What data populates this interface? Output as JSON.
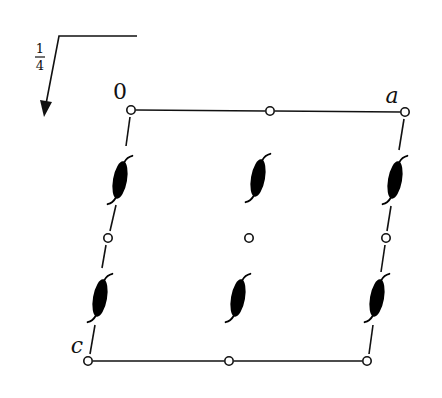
{
  "figure": {
    "type": "space-group symmetry diagram (projection of unit cell)",
    "height_fraction": {
      "numerator": "1",
      "denominator": "4"
    },
    "labels": {
      "origin": "0",
      "a_axis": "a",
      "c_axis": "c"
    },
    "cell_corners": {
      "origin": [
        131,
        110
      ],
      "a": [
        405,
        112
      ],
      "c": [
        88,
        361
      ],
      "ac": [
        367,
        361
      ]
    },
    "inversion_centers": [
      {
        "x": 131,
        "y": 110
      },
      {
        "x": 270,
        "y": 111
      },
      {
        "x": 405,
        "y": 112
      },
      {
        "x": 108,
        "y": 238
      },
      {
        "x": 249,
        "y": 238
      },
      {
        "x": 386,
        "y": 238
      },
      {
        "x": 88,
        "y": 361
      },
      {
        "x": 229,
        "y": 361
      },
      {
        "x": 367,
        "y": 361
      }
    ],
    "twofold_screw_axes": [
      {
        "x": 120,
        "y": 180
      },
      {
        "x": 258,
        "y": 178
      },
      {
        "x": 395,
        "y": 180
      },
      {
        "x": 100,
        "y": 298
      },
      {
        "x": 238,
        "y": 298
      },
      {
        "x": 377,
        "y": 298
      }
    ],
    "colors": {
      "ink": "#111111",
      "background": "#ffffff"
    }
  }
}
